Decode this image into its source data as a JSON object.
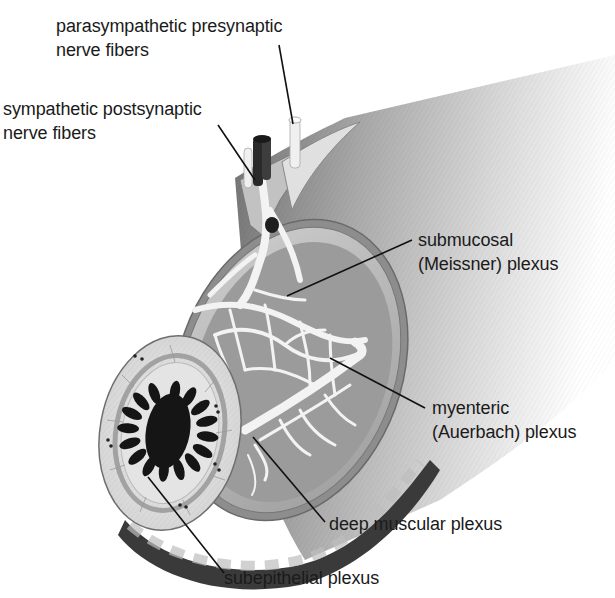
{
  "diagram": {
    "labels": [
      {
        "id": "parasympathetic",
        "line1": "parasympathetic presynaptic",
        "line2": "nerve fibers"
      },
      {
        "id": "sympathetic",
        "line1": "sympathetic postsynaptic",
        "line2": "nerve fibers"
      },
      {
        "id": "submucosal",
        "line1": "submucosal",
        "line2": "(Meissner) plexus"
      },
      {
        "id": "myenteric",
        "line1": "myenteric",
        "line2": "(Auerbach) plexus"
      },
      {
        "id": "deep-muscular",
        "line1": "deep muscular plexus"
      },
      {
        "id": "subepithelial",
        "line1": "subepithelial plexus"
      }
    ],
    "colors": {
      "background": "#ffffff",
      "text": "#1a1a1a",
      "leader_line": "#111111",
      "tube_shadow": "#8a8a8a",
      "tube_light": "#e6e6e6",
      "muscle_layer": "#9a9a9a",
      "nerve_network": "#f2f2f2",
      "lumen": "#151515"
    }
  }
}
